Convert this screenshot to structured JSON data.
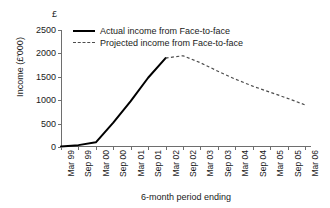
{
  "chart_data": {
    "type": "line",
    "title": "",
    "xlabel": "6-month period ending",
    "ylabel": "Income (£'000)",
    "currency_symbol": "£",
    "grid": false,
    "legend_position": "top-left-inside",
    "ylim": [
      0,
      2500
    ],
    "yticks": [
      0,
      500,
      1000,
      1500,
      2000,
      2500
    ],
    "ytick_labels": [
      "0",
      "500",
      "1000",
      "1500",
      "2000",
      "2500"
    ],
    "categories": [
      "Mar 99",
      "Sep 99",
      "Mar 00",
      "Sep 00",
      "Mar 01",
      "Sep 01",
      "Mar 02",
      "Sep 02",
      "Mar 03",
      "Sep 03",
      "Mar 04",
      "Sep 04",
      "Mar 05",
      "Sep 05",
      "Mar 06"
    ],
    "series": [
      {
        "name": "Actual income from Face-to-face",
        "style": "solid",
        "color": "#000000",
        "x": [
          "Mar 99",
          "Sep 99",
          "Mar 00",
          "Sep 00",
          "Mar 01",
          "Sep 01",
          "Mar 02"
        ],
        "values": [
          10,
          40,
          100,
          520,
          980,
          1480,
          1900
        ]
      },
      {
        "name": "Projected income from Face-to-face",
        "style": "dashed",
        "color": "#4d4d4d",
        "x": [
          "Mar 02",
          "Sep 02",
          "Mar 03",
          "Sep 03",
          "Mar 04",
          "Sep 04",
          "Mar 05",
          "Sep 05",
          "Mar 06"
        ],
        "values": [
          1900,
          1950,
          1800,
          1620,
          1450,
          1300,
          1170,
          1040,
          900
        ]
      }
    ]
  },
  "legend": {
    "entries": [
      {
        "label": "Actual income from Face-to-face"
      },
      {
        "label": "Projected income from Face-to-face"
      }
    ]
  }
}
